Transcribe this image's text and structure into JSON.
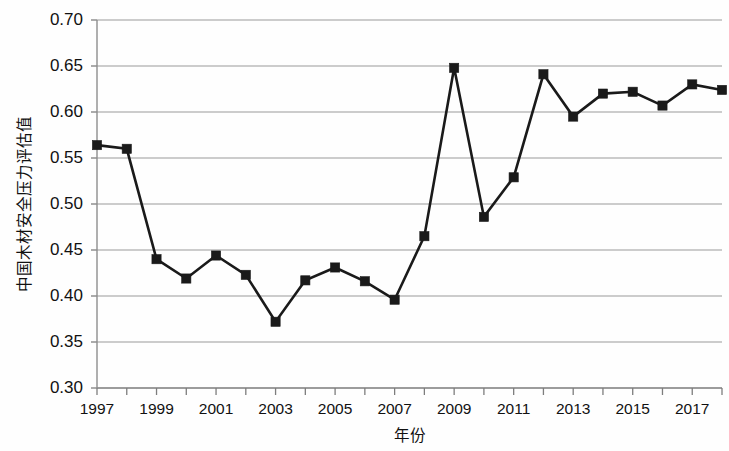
{
  "chart_data": {
    "type": "line",
    "title": "",
    "xlabel": "年份",
    "ylabel": "中国木材安全压力评估值",
    "x": [
      1997,
      1998,
      1999,
      2000,
      2001,
      2002,
      2003,
      2004,
      2005,
      2006,
      2007,
      2008,
      2009,
      2010,
      2011,
      2012,
      2013,
      2014,
      2015,
      2016,
      2017,
      2018
    ],
    "categories": [
      "1997",
      "1998",
      "1999",
      "2000",
      "2001",
      "2002",
      "2003",
      "2004",
      "2005",
      "2006",
      "2007",
      "2008",
      "2009",
      "2010",
      "2011",
      "2012",
      "2013",
      "2014",
      "2015",
      "2016",
      "2017",
      "2018"
    ],
    "values": [
      0.564,
      0.56,
      0.44,
      0.419,
      0.444,
      0.423,
      0.372,
      0.417,
      0.431,
      0.416,
      0.396,
      0.465,
      0.648,
      0.486,
      0.529,
      0.641,
      0.595,
      0.62,
      0.622,
      0.607,
      0.63,
      0.624
    ],
    "series": [
      {
        "name": "中国木材安全压力评估值",
        "values": [
          0.564,
          0.56,
          0.44,
          0.419,
          0.444,
          0.423,
          0.372,
          0.417,
          0.431,
          0.416,
          0.396,
          0.465,
          0.648,
          0.486,
          0.529,
          0.641,
          0.595,
          0.62,
          0.622,
          0.607,
          0.63,
          0.624
        ]
      }
    ],
    "ylim": [
      0.3,
      0.7
    ],
    "xlim": [
      1997,
      2018
    ],
    "ytick_labels": [
      "0.70",
      "0.65",
      "0.60",
      "0.55",
      "0.50",
      "0.45",
      "0.40",
      "0.35",
      "0.30"
    ],
    "ytick_values": [
      0.7,
      0.65,
      0.6,
      0.55,
      0.5,
      0.45,
      0.4,
      0.35,
      0.3
    ],
    "xtick_labels": [
      "1997",
      "1999",
      "2001",
      "2003",
      "2005",
      "2007",
      "2009",
      "2011",
      "2013",
      "2015",
      "2017"
    ],
    "xtick_values": [
      1997,
      1999,
      2001,
      2003,
      2005,
      2007,
      2009,
      2011,
      2013,
      2015,
      2017
    ],
    "grid": "horizontal",
    "legend": "none",
    "marker": "square",
    "line_color": "#1a1a1a",
    "grid_color": "#9a9a9a"
  }
}
